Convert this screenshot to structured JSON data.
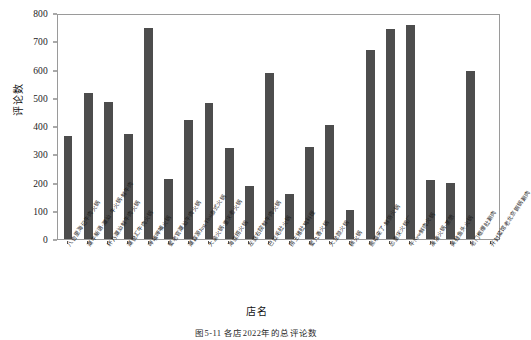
{
  "chart_data": {
    "type": "bar",
    "title": "",
    "caption": "图5-11  各店2022年的总评论数",
    "xlabel": "店名",
    "ylabel": "评论数",
    "ylim": [
      0,
      800
    ],
    "ytick_labels": [
      "0",
      "100",
      "200",
      "300",
      "400",
      "500",
      "600",
      "700",
      "800"
    ],
    "ytick_values": [
      0,
      100,
      200,
      300,
      400,
      500,
      600,
      700,
      800
    ],
    "grid": false,
    "legend": false,
    "bar_color": "#4d4d4d",
    "categories": [
      "八合里海记牛肉火锅",
      "潮牛新语·潮汕·牛火锅·鲜牛肉",
      "杯乃潮汕鲜牛肉火锅",
      "潮悦汇牛肉火锅",
      "呷哺呷哺火锅",
      "蜀老官潮汕牛肉火锅",
      "潮霖源Just Thai泰式火锅",
      "大渝火锅·重庆老火锅",
      "海底捞火锅",
      "左庭右院鲜牛肉火锅",
      "巴奴毛肚火锅",
      "捞王猪肚鸡料理",
      "蜀九香火锅",
      "大龙燚火锅",
      "楠火锅",
      "熊喵来了·鲜货火锅",
      "怂重庆火锅厂",
      "牛New鲜肉火锅",
      "凑凑火锅·茶憩",
      "美蛙鱼头火锅",
      "老门框爆肚涮肉",
      "开封菜馆老北京铜锅涮肉"
    ],
    "values": [
      365,
      516,
      486,
      372,
      748,
      213,
      421,
      483,
      323,
      186,
      588,
      161,
      325,
      404,
      104,
      669,
      745,
      757,
      209,
      200,
      593,
      0
    ]
  }
}
